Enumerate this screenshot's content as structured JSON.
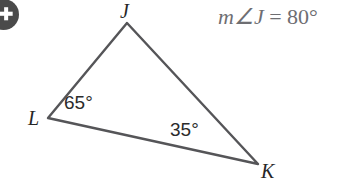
{
  "canvas": {
    "width": 362,
    "height": 188,
    "background_color": "#ffffff"
  },
  "corner_badge": {
    "name": "cropped-circular-badge",
    "glyph": "✚",
    "fill_color": "#3b3b3b",
    "glyph_color": "#ffffff"
  },
  "equation": {
    "measure_prefix": "m∠J",
    "equals": "=",
    "value": "80°",
    "full_text": "m∠J = 80°",
    "color": "#6e6e72"
  },
  "figure": {
    "type": "triangle",
    "stroke_color": "#555558",
    "stroke_width": 2.4,
    "vertices": [
      {
        "label": "J",
        "x": 127,
        "y": 23
      },
      {
        "label": "L",
        "x": 48,
        "y": 118
      },
      {
        "label": "K",
        "x": 258,
        "y": 164
      }
    ],
    "edges": [
      {
        "from": "J",
        "to": "L"
      },
      {
        "from": "J",
        "to": "K"
      },
      {
        "from": "L",
        "to": "K"
      }
    ],
    "angle_labels": [
      {
        "at_vertex": "L",
        "text": "65°",
        "value": 65
      },
      {
        "at_vertex": "K",
        "text": "35°",
        "value": 35
      },
      {
        "at_vertex": "J",
        "text": "80°",
        "value": 80
      }
    ],
    "vertex_label_color": "#262626",
    "angle_label_color": "#2b2b2b"
  }
}
